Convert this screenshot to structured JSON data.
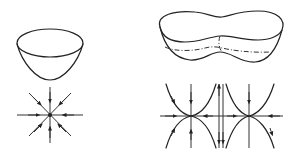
{
  "figure": {
    "panels": [
      {
        "id": "single-minimum",
        "surface": "bowl-shaped potential surface with one minimum",
        "phase_portrait": "stable node with 8 trajectories converging to center"
      },
      {
        "id": "double-minimum",
        "surface": "peanut-shaped double-well potential surface with dashed contour",
        "phase_portrait": "two attracting points on horizontal axis with hyperbolic trajectories and vertical separatrix"
      }
    ],
    "colors": {
      "line": "#222222",
      "background": "#ffffff"
    }
  }
}
